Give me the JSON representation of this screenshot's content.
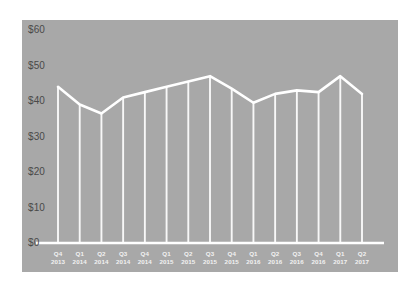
{
  "chart_data": {
    "type": "line",
    "title": "",
    "subtitle": "",
    "xlabel": "",
    "ylabel": "",
    "categories": [
      "Q4 2013",
      "Q1 2014",
      "Q2 2014",
      "Q3 2014",
      "Q4 2014",
      "Q1 2015",
      "Q2 2015",
      "Q3 2015",
      "Q4 2015",
      "Q1 2016",
      "Q2 2016",
      "Q3 2016",
      "Q4 2016",
      "Q1 2017",
      "Q2 2017"
    ],
    "quarters": [
      "Q4",
      "Q1",
      "Q2",
      "Q3",
      "Q4",
      "Q1",
      "Q2",
      "Q3",
      "Q4",
      "Q1",
      "Q2",
      "Q3",
      "Q4",
      "Q1",
      "Q2"
    ],
    "years": [
      "2013",
      "2014",
      "2014",
      "2014",
      "2014",
      "2015",
      "2015",
      "2015",
      "2015",
      "2016",
      "2016",
      "2016",
      "2016",
      "2017",
      "2017"
    ],
    "values": [
      44,
      39,
      36.5,
      41,
      42.5,
      44,
      45.5,
      47,
      43.5,
      39.5,
      42,
      43,
      42.5,
      47,
      42
    ],
    "ytick_labels": [
      "$60",
      "$50",
      "$40",
      "$30",
      "$20",
      "$10",
      "$0"
    ],
    "ytick_values": [
      60,
      50,
      40,
      30,
      20,
      10,
      0
    ],
    "ylim": [
      0,
      60
    ],
    "grid": false,
    "legend": "none",
    "series_color": "#ffffff",
    "panel_color": "#a8a8a8",
    "background_color": "#ffffff",
    "axis_label_color": "#4a4a4a",
    "xtick_label_color": "#f2f2f2"
  }
}
